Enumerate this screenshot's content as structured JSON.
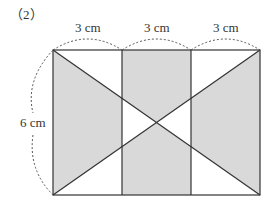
{
  "problem_number": "（2）",
  "labels": {
    "top_segment_1": "3 cm",
    "top_segment_2": "3 cm",
    "top_segment_3": "3 cm",
    "height": "6 cm"
  },
  "colors": {
    "shade": "#d9d9d9",
    "line": "#333333"
  }
}
